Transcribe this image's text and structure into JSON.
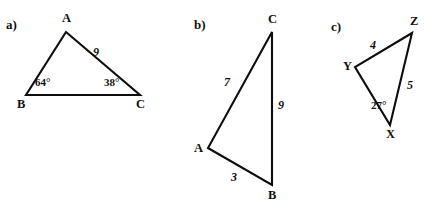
{
  "figure": {
    "background_color": "#ffffff",
    "stroke_color": "#0d0d0d",
    "text_color": "#111111",
    "parts": [
      {
        "tag": "a)",
        "vertices": [
          {
            "name": "A",
            "label": "A",
            "x": 66,
            "y": 32
          },
          {
            "name": "B",
            "label": "B",
            "x": 26,
            "y": 95
          },
          {
            "name": "C",
            "label": "C",
            "x": 140,
            "y": 95
          }
        ],
        "side_labels": [
          {
            "name": "side-AC",
            "text": "9"
          }
        ],
        "angle_labels": [
          {
            "name": "angle-B",
            "text": "64°"
          },
          {
            "name": "angle-C",
            "text": "38°"
          }
        ]
      },
      {
        "tag": "b)",
        "vertices": [
          {
            "name": "C",
            "label": "C",
            "x": 272,
            "y": 32
          },
          {
            "name": "A",
            "label": "A",
            "x": 208,
            "y": 148
          },
          {
            "name": "B",
            "label": "B",
            "x": 272,
            "y": 185
          }
        ],
        "side_labels": [
          {
            "name": "side-AC",
            "text": "7"
          },
          {
            "name": "side-BC",
            "text": "9"
          },
          {
            "name": "side-AB",
            "text": "3"
          }
        ],
        "angle_labels": []
      },
      {
        "tag": "c)",
        "vertices": [
          {
            "name": "Z",
            "label": "Z",
            "x": 412,
            "y": 33
          },
          {
            "name": "Y",
            "label": "Y",
            "x": 355,
            "y": 67
          },
          {
            "name": "X",
            "label": "X",
            "x": 390,
            "y": 125
          }
        ],
        "side_labels": [
          {
            "name": "side-YZ",
            "text": "4"
          },
          {
            "name": "side-XZ",
            "text": "5"
          }
        ],
        "angle_labels": [
          {
            "name": "angle-X",
            "text": "27°"
          }
        ]
      }
    ]
  },
  "labels": {
    "part_a_tag": "a)",
    "part_b_tag": "b)",
    "part_c_tag": "c)",
    "a_vertex_A": "A",
    "a_vertex_B": "B",
    "a_vertex_C": "C",
    "a_side_9": "9",
    "a_angle_64": "64°",
    "a_angle_38": "38°",
    "b_vertex_A": "A",
    "b_vertex_B": "B",
    "b_vertex_C": "C",
    "b_side_7": "7",
    "b_side_9": "9",
    "b_side_3": "3",
    "c_vertex_X": "X",
    "c_vertex_Y": "Y",
    "c_vertex_Z": "Z",
    "c_side_4": "4",
    "c_side_5": "5",
    "c_angle_27": "27°"
  }
}
